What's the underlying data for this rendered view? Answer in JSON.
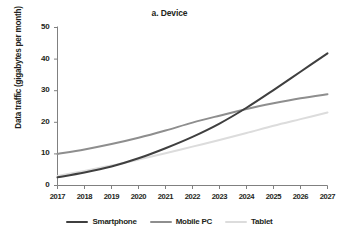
{
  "chart_data": {
    "type": "line",
    "title": "a. Device",
    "xlabel": "",
    "ylabel": "Data traffic (gigabytes per month)",
    "x": [
      2017,
      2018,
      2019,
      2020,
      2021,
      2022,
      2023,
      2024,
      2025,
      2026,
      2027
    ],
    "xtick_labels": [
      "2017",
      "2018",
      "2019",
      "2020",
      "2021",
      "2022",
      "2023",
      "2024",
      "2025",
      "2026",
      "2027"
    ],
    "ytick_labels": [
      "0",
      "10",
      "20",
      "30",
      "40",
      "50"
    ],
    "yticks": [
      0,
      10,
      20,
      30,
      40,
      50
    ],
    "xlim": [
      2017,
      2027
    ],
    "ylim": [
      0,
      50
    ],
    "grid": false,
    "legend_position": "bottom",
    "series": [
      {
        "name": "Smartphone",
        "color": "#3f3f3f",
        "values": [
          2.6,
          4.1,
          6.0,
          8.6,
          11.8,
          15.4,
          19.6,
          24.6,
          30.2,
          36.0,
          41.8
        ]
      },
      {
        "name": "Mobile PC",
        "color": "#8e8e8e",
        "values": [
          10.0,
          11.4,
          13.1,
          15.1,
          17.4,
          19.9,
          22.1,
          24.2,
          26.0,
          27.6,
          28.9
        ]
      },
      {
        "name": "Tablet",
        "color": "#dcdcdc",
        "values": [
          3.0,
          4.6,
          6.3,
          8.2,
          10.2,
          12.3,
          14.4,
          16.6,
          18.9,
          21.0,
          23.1
        ]
      }
    ]
  },
  "legend": {
    "items": [
      {
        "label": "Smartphone",
        "color": "#3f3f3f"
      },
      {
        "label": "Mobile PC",
        "color": "#8e8e8e"
      },
      {
        "label": "Tablet",
        "color": "#dcdcdc"
      }
    ]
  },
  "axes": {
    "axis_color": "#808080"
  }
}
